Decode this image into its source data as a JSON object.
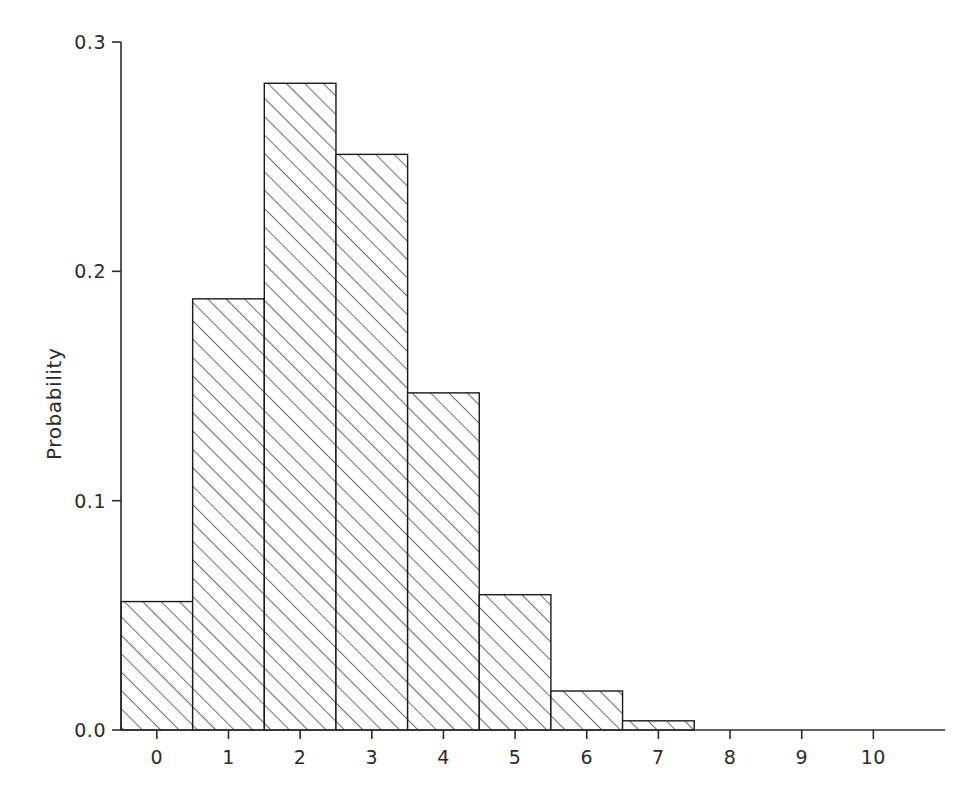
{
  "chart_data": {
    "type": "bar",
    "title": "",
    "subtitle": "",
    "xlabel": "",
    "ylabel": "Probability",
    "categories": [
      "0",
      "1",
      "2",
      "3",
      "4",
      "5",
      "6",
      "7",
      "8",
      "9",
      "10"
    ],
    "x": [
      0,
      1,
      2,
      3,
      4,
      5,
      6,
      7,
      8,
      9,
      10
    ],
    "values": [
      0.056,
      0.188,
      0.282,
      0.251,
      0.147,
      0.059,
      0.017,
      0.004,
      0.0,
      0.0,
      0.0
    ],
    "series": [
      {
        "name": "Probability",
        "values": [
          0.056,
          0.188,
          0.282,
          0.251,
          0.147,
          0.059,
          0.017,
          0.004,
          0.0,
          0.0,
          0.0
        ]
      }
    ],
    "bar_width": 1,
    "xlim": [
      -0.5,
      11.0
    ],
    "ylim": [
      0.0,
      0.3
    ],
    "y_ticks": [
      0.0,
      0.1,
      0.2,
      0.3
    ],
    "y_tick_labels": [
      "0.0",
      "0.1",
      "0.2",
      "0.3"
    ],
    "x_ticks": [
      0,
      1,
      2,
      3,
      4,
      5,
      6,
      7,
      8,
      9,
      10
    ],
    "x_tick_labels": [
      "0",
      "1",
      "2",
      "3",
      "4",
      "5",
      "6",
      "7",
      "8",
      "9",
      "10"
    ],
    "grid": false,
    "legend": false,
    "legend_position": "none",
    "bar_fill": "#ffffff",
    "bar_edge_color": "#1a1a1a",
    "bar_hatch": "diagonal-forward",
    "hatch_color": "#3a3a3a",
    "axis_color": "#2b2b2b",
    "background": "#ffffff",
    "annotations": []
  }
}
